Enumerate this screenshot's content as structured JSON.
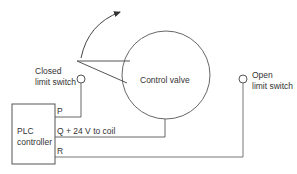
{
  "diagram": {
    "valve_label": "Control valve",
    "closed_switch": {
      "line1": "Closed",
      "line2": "limit switch"
    },
    "open_switch": {
      "line1": "Open",
      "line2": "limit switch"
    },
    "plc": {
      "line1": "PLC",
      "line2": "controller"
    },
    "terminals": {
      "p": "P",
      "q": "Q + 24 V to coil",
      "r": "R"
    },
    "colors": {
      "line": "#555555",
      "text": "#333333"
    }
  }
}
